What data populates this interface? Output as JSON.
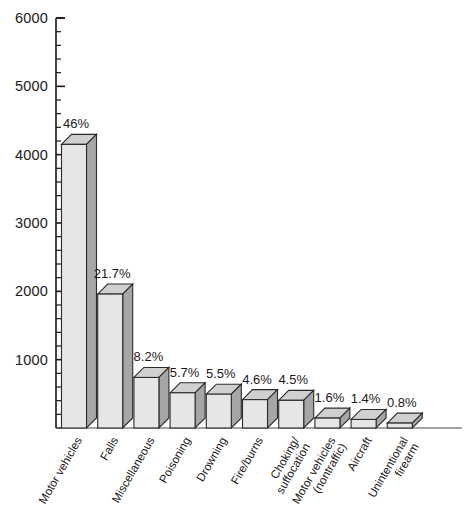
{
  "chart_data": {
    "type": "bar",
    "title": "",
    "subtitle": "",
    "xlabel": "",
    "ylabel": "",
    "ylim": [
      0,
      6000
    ],
    "ytick_interval": 1000,
    "yminor_interval": 200,
    "grid": false,
    "legend": "none",
    "style": "3d-shaded-bars",
    "categories": [
      "Motor vehicles",
      "Falls",
      "Miscellaneous",
      "Poisoning",
      "Drowning",
      "Fire/burns",
      "Choking/ suffocation",
      "Motor vehicles (nontraffic)",
      "Aircraft",
      "Unintentional firearm"
    ],
    "category_lines": [
      [
        "Motor vehicles"
      ],
      [
        "Falls"
      ],
      [
        "Miscellaneous"
      ],
      [
        "Poisoning"
      ],
      [
        "Drowning"
      ],
      [
        "Fire/burns"
      ],
      [
        "Choking/",
        "suffocation"
      ],
      [
        "Motor vehicles",
        "(nontraffic)"
      ],
      [
        "Aircraft"
      ],
      [
        "Unintentional",
        "firearm"
      ]
    ],
    "values": [
      4150,
      1960,
      740,
      515,
      495,
      415,
      405,
      145,
      125,
      72
    ],
    "data_labels": [
      "46%",
      "21.7%",
      "8.2%",
      "5.7%",
      "5.5%",
      "4.6%",
      "4.5%",
      "1.6%",
      "1.4%",
      "0.8%"
    ],
    "percentages": [
      46,
      21.7,
      8.2,
      5.7,
      5.5,
      4.6,
      4.5,
      1.6,
      1.4,
      0.8
    ],
    "ytick_labels": [
      "6000",
      "5000",
      "4000",
      "3000",
      "2000",
      "1000"
    ],
    "ytick_values": [
      6000,
      5000,
      4000,
      3000,
      2000,
      1000
    ],
    "colors": {
      "bar_front": "#e6e6e6",
      "bar_side": "#a6a6a6",
      "bar_top": "#d0d0d0",
      "outline": "#2b2b2b",
      "axis": "#1a1a1a",
      "background": "#ffffff"
    }
  }
}
